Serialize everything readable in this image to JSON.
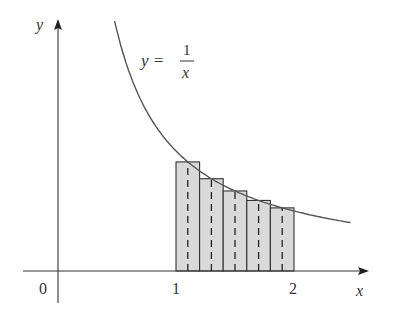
{
  "chart_data": {
    "type": "area",
    "title": "",
    "function_label": {
      "lhs": "y =",
      "numerator": "1",
      "denominator": "x"
    },
    "xlabel": "x",
    "ylabel": "y",
    "x_ticks": [
      "0",
      "1",
      "2"
    ],
    "curve": {
      "expr": "1/x",
      "x_start": 0.48,
      "x_end": 2.48
    },
    "rectangles": {
      "method": "midpoint",
      "a": 1,
      "b": 2,
      "n": 5,
      "midpoints": [
        1.1,
        1.3,
        1.5,
        1.7,
        1.9
      ],
      "heights": [
        0.909,
        0.769,
        0.667,
        0.588,
        0.526
      ]
    },
    "colors": {
      "fill": "#d9d9d9",
      "stroke": "#333333",
      "curve": "#555555"
    }
  }
}
